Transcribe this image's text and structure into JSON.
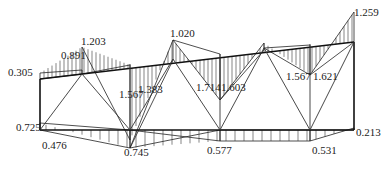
{
  "diagram": {
    "type": "truss-internal-force-diagram",
    "labels": [
      {
        "id": "top-left-end",
        "text": "0.305"
      },
      {
        "id": "top-panel1-a",
        "text": "0.891"
      },
      {
        "id": "top-panel1-b",
        "text": "1.203"
      },
      {
        "id": "top-node2",
        "text": "1.020"
      },
      {
        "id": "top-node-right",
        "text": "1.259"
      },
      {
        "id": "sag1-left",
        "text": "1.567"
      },
      {
        "id": "sag1-right",
        "text": "1.383"
      },
      {
        "id": "sag2-left",
        "text": "1.714"
      },
      {
        "id": "sag2-right",
        "text": "1.603"
      },
      {
        "id": "sag3-left",
        "text": "1.567"
      },
      {
        "id": "sag3-right",
        "text": "1.621"
      },
      {
        "id": "bottom-left-end",
        "text": "0.725"
      },
      {
        "id": "bottom-node1",
        "text": "0.476"
      },
      {
        "id": "bottom-node2",
        "text": "0.745"
      },
      {
        "id": "bottom-node3",
        "text": "0.577"
      },
      {
        "id": "bottom-node4",
        "text": "0.531"
      },
      {
        "id": "bottom-right-end",
        "text": "0.213"
      }
    ]
  }
}
